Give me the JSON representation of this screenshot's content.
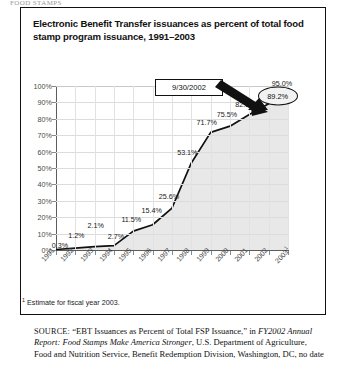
{
  "page": {
    "top_fragment": "FOOD STAMPS"
  },
  "figure": {
    "title": "Electronic Benefit Transfer issuances as percent of total food stamp program issuance, 1991–2003",
    "callout": {
      "label": "9/30/2002",
      "points_to_value": "89.2%"
    },
    "highlight": {
      "circled_label": "89.2%"
    },
    "footnote": {
      "marker": "1",
      "text": "Estimate for fiscal year 2003."
    },
    "source": {
      "prefix": "SOURCE:",
      "part1": " “EBT Issuances as Percent of Total FSP Issuance,” in ",
      "italic": "FY2002 Annual Report: Food Stamps Make America Stronger",
      "part2": ", U.S. Department of Agriculture, Food and Nutrition Service, Benefit Redemption Division, Washington, DC, no date"
    }
  },
  "chart_data": {
    "type": "area",
    "title": "Electronic Benefit Transfer issuances as percent of total food stamp program issuance, 1991–2003",
    "xlabel": "",
    "ylabel": "",
    "ylim": [
      0,
      100
    ],
    "ytick_labels": [
      "0%",
      "10%",
      "20%",
      "30%",
      "40%",
      "50%",
      "60%",
      "70%",
      "80%",
      "90%",
      "100%"
    ],
    "ytick_values": [
      0,
      10,
      20,
      30,
      40,
      50,
      60,
      70,
      80,
      90,
      100
    ],
    "grid": true,
    "legend": "none",
    "categories": [
      "1991",
      "1992",
      "1993",
      "1994",
      "1995",
      "1996",
      "1997",
      "1998",
      "1999",
      "2000",
      "2001",
      "2002",
      "2003"
    ],
    "x_tick_labels": [
      "1991",
      "1992",
      "1993",
      "1994",
      "1995",
      "1996",
      "1997",
      "1998",
      "1999",
      "2000",
      "2001",
      "2002",
      "2003¹"
    ],
    "values": [
      0.3,
      1.2,
      2.1,
      2.7,
      11.5,
      15.4,
      25.6,
      53.1,
      71.7,
      75.5,
      82.6,
      89.2,
      95.0
    ],
    "data_labels": [
      "0.3%",
      "1.2%",
      "2.1%",
      "2.7%",
      "11.5%",
      "15.4%",
      "25.6%",
      "53.1%",
      "71.7%",
      "75.5%",
      "82.6%",
      "89.2%",
      "95.0%"
    ],
    "annotations": [
      {
        "text": "9/30/2002",
        "type": "callout-box",
        "target_category": "2002",
        "target_value": 89.2
      }
    ]
  }
}
